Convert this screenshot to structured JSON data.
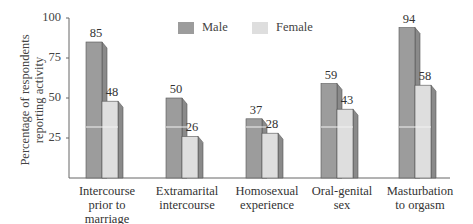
{
  "chart_data": {
    "type": "bar",
    "title": "",
    "xlabel": "",
    "ylabel": "Percentage of respondents reporting activity",
    "ylabel_lines": [
      "Percentage of respondents",
      "reporting activity"
    ],
    "ylim": [
      0,
      100
    ],
    "yticks": [
      25,
      50,
      75,
      100
    ],
    "grid": false,
    "legend_position": "top",
    "categories": [
      [
        "Intercourse",
        "prior to",
        "marriage"
      ],
      [
        "Extramarital",
        "intercourse"
      ],
      [
        "Homosexual",
        "experience"
      ],
      [
        "Oral-genital",
        "sex"
      ],
      [
        "Masturbation",
        "to orgasm"
      ]
    ],
    "series": [
      {
        "name": "Male",
        "color": "#9c9c9c",
        "values": [
          85,
          50,
          37,
          59,
          94
        ]
      },
      {
        "name": "Female",
        "color": "#dedede",
        "values": [
          48,
          26,
          28,
          43,
          58
        ]
      }
    ]
  },
  "colors": {
    "axis": "#666666",
    "side_face": "#8a8a8a",
    "bar_edge": "#555555"
  }
}
